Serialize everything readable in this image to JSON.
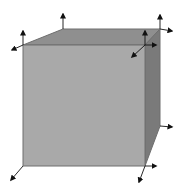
{
  "diagram": {
    "type": "3d-cube-with-corner-vectors",
    "colors": {
      "background": "#ffffff",
      "front_face": "#a9a9a9",
      "top_face": "#8f8f8f",
      "right_face": "#7a7a7a",
      "edge": "#6e6e6e",
      "arrow": "#111111"
    },
    "cube": {
      "front_face": [
        [
          23,
          45
        ],
        [
          145,
          45
        ],
        [
          145,
          166
        ],
        [
          23,
          166
        ]
      ],
      "top_face": [
        [
          23,
          45
        ],
        [
          63,
          29
        ],
        [
          160,
          29
        ],
        [
          145,
          45
        ]
      ],
      "right_face": [
        [
          145,
          45
        ],
        [
          160,
          29
        ],
        [
          160,
          126
        ],
        [
          145,
          166
        ]
      ]
    },
    "arrows": [
      {
        "name": "front-top-left-up",
        "from": [
          23,
          45
        ],
        "to": [
          23,
          31
        ]
      },
      {
        "name": "front-top-left-out",
        "from": [
          23,
          45
        ],
        "to": [
          12,
          50
        ]
      },
      {
        "name": "back-top-left-up",
        "from": [
          63,
          29
        ],
        "to": [
          63,
          14
        ]
      },
      {
        "name": "back-top-right-up",
        "from": [
          160,
          29
        ],
        "to": [
          160,
          15
        ]
      },
      {
        "name": "back-top-right-right",
        "from": [
          160,
          29
        ],
        "to": [
          172,
          31
        ]
      },
      {
        "name": "front-top-right-up",
        "from": [
          145,
          45
        ],
        "to": [
          145,
          31
        ]
      },
      {
        "name": "front-top-right-right",
        "from": [
          145,
          45
        ],
        "to": [
          156,
          45
        ]
      },
      {
        "name": "front-top-right-out",
        "from": [
          145,
          45
        ],
        "to": [
          132,
          57
        ]
      },
      {
        "name": "back-bottom-right-right",
        "from": [
          160,
          126
        ],
        "to": [
          172,
          127
        ]
      },
      {
        "name": "front-bottom-right-right",
        "from": [
          145,
          166
        ],
        "to": [
          156,
          166
        ]
      },
      {
        "name": "front-bottom-right-out",
        "from": [
          145,
          166
        ],
        "to": [
          139,
          182
        ]
      },
      {
        "name": "front-bottom-left-out",
        "from": [
          23,
          166
        ],
        "to": [
          11,
          180
        ]
      }
    ]
  }
}
